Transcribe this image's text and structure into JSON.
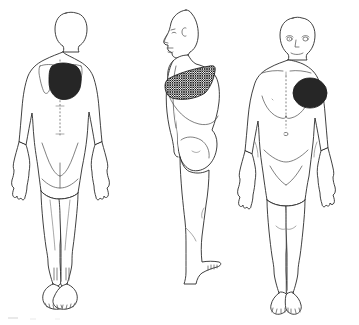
{
  "document": {
    "title": "Body Chart",
    "type": "anatomical-body-chart",
    "background_color": "#ffffff",
    "outline_color": "#2b2b2b",
    "detail_color": "#4a4a4a",
    "marking_color": "#1a1a1a",
    "width": 359,
    "height": 325
  },
  "figures": [
    {
      "id": "posterior",
      "label": "Posterior view",
      "position": "left",
      "orientation": "back",
      "markings": [
        {
          "id": "posterior-marking-1",
          "label": "Shaded region left upper back",
          "pattern": "cross-hatch",
          "region": "left scapular / upper thoracic back",
          "side": "left"
        }
      ],
      "landmarks": [
        "scapula-outline-left",
        "scapula-outline-right",
        "spine-midline-dotted",
        "gluteal-cleft",
        "heels",
        "toes"
      ]
    },
    {
      "id": "lateral",
      "label": "Lateral view",
      "position": "center",
      "orientation": "side",
      "markings": [
        {
          "id": "lateral-marking-1",
          "label": "Shaded band across chest and flank",
          "pattern": "cross-hatch",
          "region": "mid-thoracic band, chest to back",
          "side": "left"
        }
      ],
      "landmarks": [
        "profile-face",
        "ear",
        "breast-contour",
        "gluteal-contour",
        "foot-toes"
      ]
    },
    {
      "id": "anterior",
      "label": "Anterior view",
      "position": "right",
      "orientation": "front",
      "markings": [
        {
          "id": "anterior-marking-1",
          "label": "Shaded oval region left chest",
          "pattern": "cross-hatch",
          "region": "left pectoral / upper chest",
          "side": "left"
        }
      ],
      "landmarks": [
        "face-eyes-nose-mouth",
        "clavicles",
        "sternum-midline",
        "breast-contours",
        "umbilicus",
        "inguinal-creases",
        "feet-toes"
      ]
    }
  ],
  "artifacts": {
    "bottom_left_scan_mark": "faint horizontal scan fragment"
  }
}
